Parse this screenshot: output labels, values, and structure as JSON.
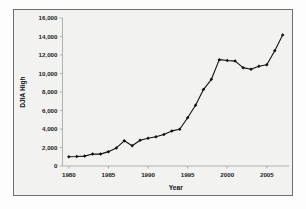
{
  "chart_data": {
    "type": "line",
    "title": "",
    "xlabel": "Year",
    "ylabel": "DJIA High",
    "xlim": [
      1979.2,
      2007.8
    ],
    "ylim": [
      0,
      16000
    ],
    "grid": false,
    "legend": "none",
    "x_ticks": [
      "1980",
      "1985",
      "1990",
      "1995",
      "2000",
      "2005"
    ],
    "x_tick_values": [
      1980,
      1985,
      1990,
      1995,
      2000,
      2005
    ],
    "y_ticks": [
      "0",
      "2,000",
      "4,000",
      "6,000",
      "8,000",
      "10,000",
      "12,000",
      "14,000",
      "16,000"
    ],
    "y_tick_values": [
      0,
      2000,
      4000,
      6000,
      8000,
      10000,
      12000,
      14000,
      16000
    ],
    "marker": "filled-diamond",
    "series": [
      {
        "name": "DJIA High",
        "x": [
          1980,
          1981,
          1982,
          1983,
          1984,
          1985,
          1986,
          1987,
          1988,
          1989,
          1990,
          1991,
          1992,
          1993,
          1994,
          1995,
          1996,
          1997,
          1998,
          1999,
          2000,
          2001,
          2002,
          2003,
          2004,
          2005,
          2006,
          2007
        ],
        "values": [
          1000,
          1024,
          1070,
          1290,
          1287,
          1553,
          1956,
          2722,
          2184,
          2791,
          3000,
          3169,
          3413,
          3794,
          3978,
          5216,
          6560,
          8259,
          9374,
          11497,
          11401,
          11338,
          10635,
          10454,
          10783,
          10941,
          12463,
          14165
        ]
      }
    ]
  },
  "axis_titles": {
    "x": "Year",
    "y": "DJIA High"
  },
  "colors": {
    "series": "#111111",
    "axis": "#a8a8a8",
    "frame": "#6e6e6e",
    "plot_background": "#f2f2f1",
    "figure_background": "#fdfdfd"
  }
}
